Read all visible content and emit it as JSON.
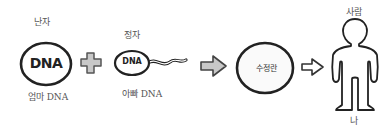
{
  "diagram": {
    "egg": {
      "top_label": "난자",
      "inner_text": "DNA",
      "bottom_label": "엄마 DNA"
    },
    "plus_symbol": "plus",
    "sperm": {
      "top_label": "정자",
      "inner_text": "DNA",
      "bottom_label": "아빠 DNA"
    },
    "arrow_1": "arrow-right",
    "zygote": {
      "inner_text": "수정란"
    },
    "arrow_2": "arrow-right",
    "person": {
      "top_label": "사람",
      "bottom_label": "나"
    },
    "colors": {
      "outline": "#222222",
      "symbol_fill": "#c8c8c8",
      "cell_fill": "#ffffff",
      "label_text": "#555555"
    }
  }
}
